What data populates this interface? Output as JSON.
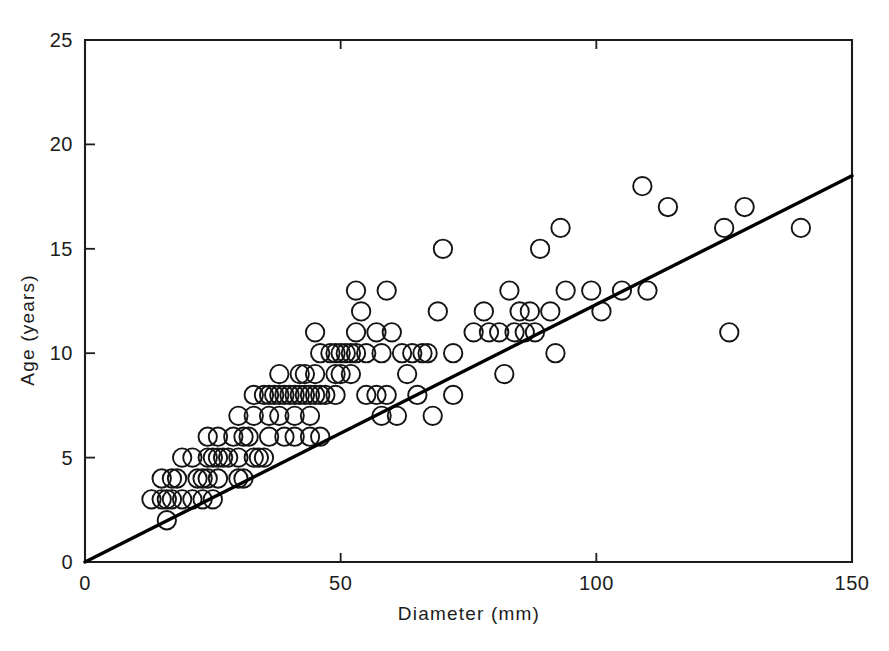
{
  "chart_data": {
    "type": "scatter",
    "title": "",
    "xlabel": "Diameter (mm)",
    "ylabel": "Age (years)",
    "xlim": [
      0,
      150
    ],
    "ylim": [
      0,
      25
    ],
    "xticks": [
      0,
      50,
      100,
      150
    ],
    "yticks": [
      0,
      5,
      10,
      15,
      20,
      25
    ],
    "xtick_labels": [
      "0",
      "50",
      "100",
      "150"
    ],
    "ytick_labels": [
      "0",
      "5",
      "10",
      "15",
      "20",
      "25"
    ],
    "grid": false,
    "legend": null,
    "marker": "open-circle",
    "series": [
      {
        "name": "Observations",
        "points": [
          [
            13,
            3
          ],
          [
            15,
            3
          ],
          [
            16,
            3
          ],
          [
            17,
            3
          ],
          [
            19,
            3
          ],
          [
            21,
            3
          ],
          [
            23,
            3
          ],
          [
            25,
            3
          ],
          [
            16,
            2
          ],
          [
            15,
            4
          ],
          [
            17,
            4
          ],
          [
            18,
            4
          ],
          [
            22,
            4
          ],
          [
            23,
            4
          ],
          [
            24,
            4
          ],
          [
            26,
            4
          ],
          [
            30,
            4
          ],
          [
            31,
            4
          ],
          [
            19,
            5
          ],
          [
            21,
            5
          ],
          [
            24,
            5
          ],
          [
            25,
            5
          ],
          [
            26,
            5
          ],
          [
            27,
            5
          ],
          [
            28,
            5
          ],
          [
            30,
            5
          ],
          [
            33,
            5
          ],
          [
            34,
            5
          ],
          [
            35,
            5
          ],
          [
            24,
            6
          ],
          [
            26,
            6
          ],
          [
            29,
            6
          ],
          [
            31,
            6
          ],
          [
            32,
            6
          ],
          [
            36,
            6
          ],
          [
            39,
            6
          ],
          [
            41,
            6
          ],
          [
            44,
            6
          ],
          [
            46,
            6
          ],
          [
            30,
            7
          ],
          [
            33,
            7
          ],
          [
            36,
            7
          ],
          [
            38,
            7
          ],
          [
            41,
            7
          ],
          [
            44,
            7
          ],
          [
            58,
            7
          ],
          [
            61,
            7
          ],
          [
            68,
            7
          ],
          [
            33,
            8
          ],
          [
            35,
            8
          ],
          [
            36,
            8
          ],
          [
            37,
            8
          ],
          [
            38,
            8
          ],
          [
            39,
            8
          ],
          [
            40,
            8
          ],
          [
            41,
            8
          ],
          [
            42,
            8
          ],
          [
            43,
            8
          ],
          [
            44,
            8
          ],
          [
            45,
            8
          ],
          [
            46,
            8
          ],
          [
            47,
            8
          ],
          [
            49,
            8
          ],
          [
            55,
            8
          ],
          [
            57,
            8
          ],
          [
            59,
            8
          ],
          [
            65,
            8
          ],
          [
            72,
            8
          ],
          [
            38,
            9
          ],
          [
            42,
            9
          ],
          [
            43,
            9
          ],
          [
            45,
            9
          ],
          [
            49,
            9
          ],
          [
            50,
            9
          ],
          [
            52,
            9
          ],
          [
            63,
            9
          ],
          [
            82,
            9
          ],
          [
            46,
            10
          ],
          [
            48,
            10
          ],
          [
            49,
            10
          ],
          [
            50,
            10
          ],
          [
            51,
            10
          ],
          [
            52,
            10
          ],
          [
            53,
            10
          ],
          [
            55,
            10
          ],
          [
            58,
            10
          ],
          [
            62,
            10
          ],
          [
            64,
            10
          ],
          [
            66,
            10
          ],
          [
            67,
            10
          ],
          [
            72,
            10
          ],
          [
            92,
            10
          ],
          [
            45,
            11
          ],
          [
            53,
            11
          ],
          [
            57,
            11
          ],
          [
            60,
            11
          ],
          [
            76,
            11
          ],
          [
            79,
            11
          ],
          [
            81,
            11
          ],
          [
            84,
            11
          ],
          [
            86,
            11
          ],
          [
            88,
            11
          ],
          [
            54,
            12
          ],
          [
            69,
            12
          ],
          [
            78,
            12
          ],
          [
            85,
            12
          ],
          [
            87,
            12
          ],
          [
            91,
            12
          ],
          [
            101,
            12
          ],
          [
            53,
            13
          ],
          [
            59,
            13
          ],
          [
            83,
            13
          ],
          [
            94,
            13
          ],
          [
            99,
            13
          ],
          [
            105,
            13
          ],
          [
            110,
            13
          ],
          [
            70,
            15
          ],
          [
            89,
            15
          ],
          [
            93,
            16
          ],
          [
            125,
            16
          ],
          [
            109,
            18
          ],
          [
            114,
            17
          ],
          [
            129,
            17
          ],
          [
            140,
            16
          ],
          [
            126,
            11
          ]
        ]
      }
    ],
    "trend_line": {
      "type": "linear-fit",
      "points": [
        [
          0,
          0
        ],
        [
          150,
          18.5
        ]
      ]
    }
  },
  "axes": {
    "x_title": "Diameter (mm)",
    "y_title": "Age (years)"
  }
}
